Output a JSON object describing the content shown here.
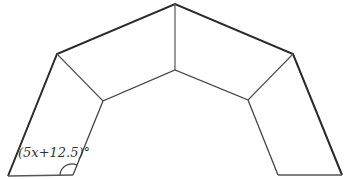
{
  "figure": {
    "angle_label": "(5x+12.5)°",
    "colors": {
      "outer_edge": "#2a2a2a",
      "inner_edge": "#444444",
      "background": "#ffffff"
    },
    "outer_vertices": [
      [
        8,
        176
      ],
      [
        57,
        54
      ],
      [
        175,
        4
      ],
      [
        293,
        54
      ],
      [
        342,
        175
      ]
    ],
    "inner_vertices": [
      [
        73,
        175
      ],
      [
        103,
        101
      ],
      [
        175,
        70
      ],
      [
        248,
        100
      ],
      [
        278,
        175
      ]
    ]
  }
}
